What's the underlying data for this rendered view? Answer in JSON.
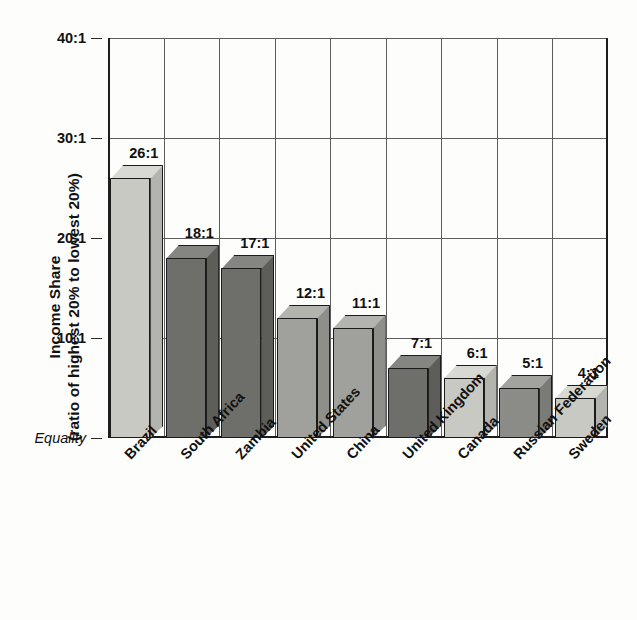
{
  "chart_data": {
    "type": "bar",
    "title": "",
    "subtitle": "",
    "xlabel": "",
    "ylabel": "Income Share (ratio of highest 20% to lowest 20%)",
    "ylabel_line1": "Income Share",
    "ylabel_line2": "(ratio of highest 20% to lowest 20%)",
    "ylim": [
      0,
      40
    ],
    "ytick_values": [
      40,
      30,
      20,
      10,
      0
    ],
    "ytick_labels": [
      "40:1",
      "30:1",
      "20:1",
      "10:1",
      "Equality"
    ],
    "grid": "horizontal-and-vertical",
    "legend": "none",
    "categories": [
      "Brazil",
      "South Africa",
      "Zambia",
      "United States",
      "China",
      "United Kingdom",
      "Canada",
      "Russian Federation",
      "Sweden"
    ],
    "values": [
      26,
      18,
      17,
      12,
      11,
      7,
      6,
      5,
      4
    ],
    "value_labels": [
      "26:1",
      "18:1",
      "17:1",
      "12:1",
      "11:1",
      "7:1",
      "6:1",
      "5:1",
      "4:1"
    ],
    "bar_colors": [
      "#c9c9c4",
      "#6e6e6b",
      "#6e6e6b",
      "#a0a09c",
      "#a0a09c",
      "#6e6e6b",
      "#c9c9c4",
      "#8b8b87",
      "#c9c9c4"
    ],
    "bar_top_colors": [
      "#d9d9d4",
      "#858581",
      "#858581",
      "#b3b3af",
      "#b3b3af",
      "#858581",
      "#d9d9d4",
      "#a2a29e",
      "#d9d9d4"
    ],
    "bar_side_colors": [
      "#b4b4af",
      "#5d5d5a",
      "#5d5d5a",
      "#8e8e8a",
      "#8e8e8a",
      "#5d5d5a",
      "#b4b4af",
      "#7a7a76",
      "#b4b4af"
    ],
    "axis_color": "#1d1d1d",
    "grid_color": "#5d5d5d",
    "text_color": "#111111",
    "background_color": "#fdfdfc"
  }
}
